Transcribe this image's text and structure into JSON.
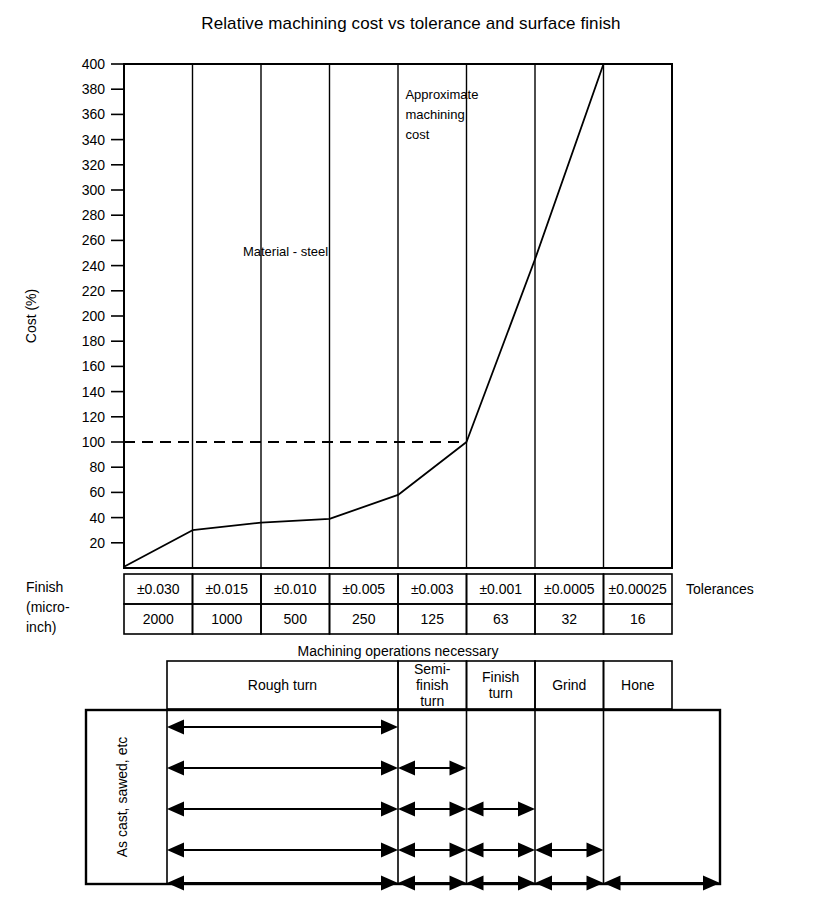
{
  "chart_data": {
    "type": "line",
    "title": "Relative machining cost vs tolerance and surface finish",
    "xlabel": "",
    "ylabel": "Cost (%)",
    "ylim": [
      0,
      400
    ],
    "ytick_step": 20,
    "yticks": [
      20,
      40,
      60,
      80,
      100,
      120,
      140,
      160,
      180,
      200,
      220,
      240,
      260,
      280,
      300,
      320,
      340,
      360,
      380,
      400
    ],
    "grid": "vertical-only",
    "legend": "none",
    "categories": [
      "±0.030",
      "±0.015",
      "±0.010",
      "±0.005",
      "±0.003",
      "±0.001",
      "±0.0005",
      "±0.00025"
    ],
    "x": [
      0,
      1,
      2,
      3,
      4,
      5,
      6,
      7
    ],
    "series": [
      {
        "name": "Approximate machining cost",
        "values": [
          1,
          30,
          36,
          39,
          58,
          100,
          245,
          400
        ]
      }
    ],
    "reference_lines": [
      {
        "name": "cost-100-reference",
        "axis": "y",
        "value": 100,
        "style": "dashed",
        "extent_x": [
          0,
          5
        ]
      }
    ],
    "annotations": [
      {
        "name": "approximate-machining-cost-note",
        "lines": [
          "Approximate",
          "machining",
          "cost"
        ],
        "x": 4.05,
        "y": 372
      },
      {
        "name": "material-steel-note",
        "lines": [
          "Material - steel"
        ],
        "x": 2.3,
        "y": 248
      }
    ]
  },
  "table": {
    "row_label_left": [
      "Finish",
      "(micro-",
      "inch)"
    ],
    "row_label_right": "Tolerances",
    "tolerances": [
      "±0.030",
      "±0.015",
      "±0.010",
      "±0.005",
      "±0.003",
      "±0.001",
      "±0.0005",
      "±0.00025"
    ],
    "finish_microinch": [
      "2000",
      "1000",
      "500",
      "250",
      "125",
      "63",
      "32",
      "16"
    ],
    "banner": "Machining operations necessary",
    "operations": [
      {
        "label": "Rough turn",
        "span_start": 0,
        "span_end": 4
      },
      {
        "label": "Semi-\nfinish\nturn",
        "span_start": 4,
        "span_end": 5
      },
      {
        "label": "Finish\nturn",
        "span_start": 5,
        "span_end": 6
      },
      {
        "label": "Grind",
        "span_start": 6,
        "span_end": 7
      },
      {
        "label": "Hone",
        "span_start": 7,
        "span_end": 8
      }
    ]
  },
  "sequence": {
    "start_label": "As cast, sawed, etc",
    "rows": [
      {
        "name": "sequence-row-1",
        "segments": [
          [
            0,
            4
          ]
        ]
      },
      {
        "name": "sequence-row-2",
        "segments": [
          [
            0,
            4
          ],
          [
            4,
            5
          ]
        ]
      },
      {
        "name": "sequence-row-3",
        "segments": [
          [
            0,
            4
          ],
          [
            4,
            5
          ],
          [
            5,
            6
          ]
        ]
      },
      {
        "name": "sequence-row-4",
        "segments": [
          [
            0,
            4
          ],
          [
            4,
            5
          ],
          [
            5,
            6
          ],
          [
            6,
            7
          ]
        ]
      },
      {
        "name": "sequence-row-5",
        "segments": [
          [
            0,
            4
          ],
          [
            4,
            5
          ],
          [
            5,
            6
          ],
          [
            6,
            7
          ],
          [
            7,
            8
          ]
        ]
      }
    ]
  },
  "style": {
    "ink": "#000000",
    "paper": "#ffffff"
  }
}
